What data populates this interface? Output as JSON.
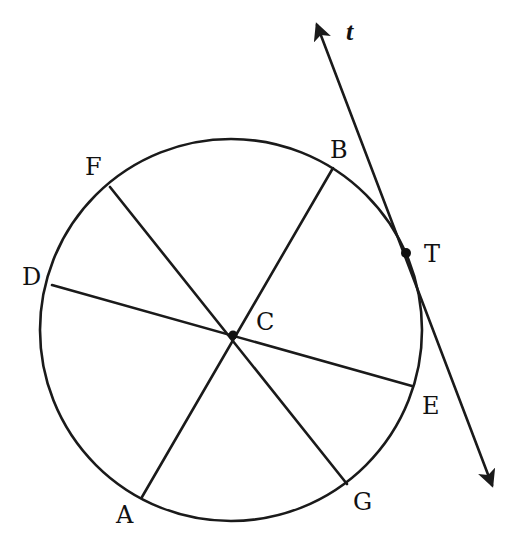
{
  "diagram": {
    "colors": {
      "stroke": "#1a1a1a",
      "background": "#ffffff"
    },
    "circle": {
      "center_label": "C",
      "cx": 231,
      "cy": 330,
      "r": 191
    },
    "points": {
      "A": {
        "label": "A",
        "x": 142,
        "y": 497
      },
      "B": {
        "label": "B",
        "x": 333,
        "y": 168
      },
      "C": {
        "label": "C",
        "x": 233,
        "y": 335
      },
      "D": {
        "label": "D",
        "x": 52,
        "y": 285
      },
      "E": {
        "label": "E",
        "x": 412,
        "y": 386
      },
      "F": {
        "label": "F",
        "x": 110,
        "y": 187
      },
      "G": {
        "label": "G",
        "x": 347,
        "y": 484
      },
      "T": {
        "label": "T",
        "x": 406,
        "y": 253
      }
    },
    "segments": [
      {
        "name": "diameter-AB",
        "from": "A",
        "to": "B"
      },
      {
        "name": "diameter-DE",
        "from": "D",
        "to": "E"
      },
      {
        "name": "diameter-FG",
        "from": "F",
        "to": "G"
      }
    ],
    "tangent_line": {
      "label": "t",
      "through": "T",
      "start": [
        317,
        25
      ],
      "end": [
        492,
        485
      ]
    }
  }
}
